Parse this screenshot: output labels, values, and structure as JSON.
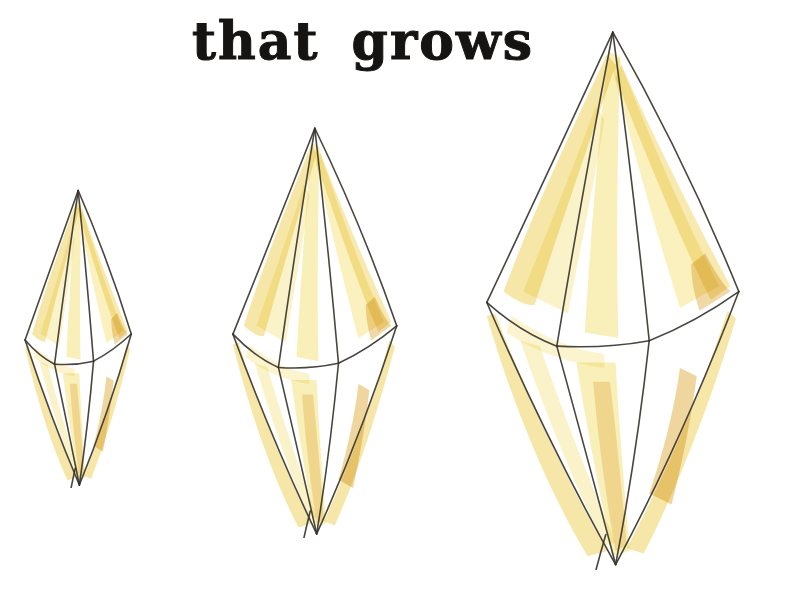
{
  "page": {
    "title": "that grows",
    "background": "#ffffff",
    "text_color": "#161412"
  },
  "illustration": {
    "kind": "watercolor-ink-drawing",
    "subject": "three yellow six-sided bipyramidal crystals growing larger from left to right",
    "palette": {
      "ink": "#35322b",
      "light_yellow": "#f6e794",
      "mid_yellow": "#f0d76e",
      "dark_yellow": "#e2b44e",
      "paper": "#ffffff"
    },
    "crystals": [
      {
        "name": "crystal-small",
        "label": "small crystal",
        "relative_size": "small"
      },
      {
        "name": "crystal-medium",
        "label": "medium crystal",
        "relative_size": "medium"
      },
      {
        "name": "crystal-large",
        "label": "large crystal",
        "relative_size": "large"
      }
    ]
  }
}
